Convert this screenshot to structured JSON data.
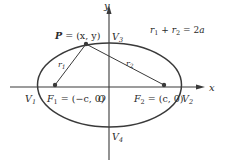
{
  "diagram": {
    "colors": {
      "stroke": "#3a3a3a",
      "text": "#2a2a2a",
      "background": "#ffffff"
    },
    "axes": {
      "x_label": "x",
      "y_label": "y",
      "origin_label": "O"
    },
    "equation": {
      "r1": "r",
      "r1_sub": "1",
      "plus": " + ",
      "r2": "r",
      "r2_sub": "2",
      "equals": " = 2",
      "a": "a"
    },
    "point_p": {
      "name": "P",
      "coords": " = (x, y)"
    },
    "segments": {
      "r1_label": "r",
      "r1_sub": "1",
      "r2_label": "r",
      "r2_sub": "2"
    },
    "foci": [
      {
        "name": "F",
        "sub": "1",
        "coords": " = (−c, 0)"
      },
      {
        "name": "F",
        "sub": "2",
        "coords": " = (c, 0)"
      }
    ],
    "vertices": [
      {
        "name": "V",
        "sub": "1"
      },
      {
        "name": "V",
        "sub": "2"
      },
      {
        "name": "V",
        "sub": "3"
      },
      {
        "name": "V",
        "sub": "4"
      }
    ]
  }
}
